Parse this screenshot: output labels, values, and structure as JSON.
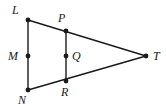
{
  "figure": {
    "background_color": "#ffffff",
    "stroke_color": "#1a1a1a",
    "label_color": "#1a1a1a",
    "point_radius": 2.4,
    "line_width": 1.4,
    "width": 166,
    "height": 109
  },
  "points": [
    {
      "id": "L",
      "label": "L",
      "x": 28,
      "y": 20,
      "label_x": 12,
      "label_y": 4
    },
    {
      "id": "P",
      "label": "P",
      "x": 66,
      "y": 31,
      "label_x": 58,
      "label_y": 12
    },
    {
      "id": "T",
      "label": "T",
      "x": 146,
      "y": 56,
      "label_x": 153,
      "label_y": 50
    },
    {
      "id": "M",
      "label": "M",
      "x": 28,
      "y": 56,
      "label_x": 8,
      "label_y": 50
    },
    {
      "id": "Q",
      "label": "Q",
      "x": 66,
      "y": 56,
      "label_x": 72,
      "label_y": 50
    },
    {
      "id": "N",
      "label": "N",
      "x": 28,
      "y": 90,
      "label_x": 18,
      "label_y": 94
    },
    {
      "id": "R",
      "label": "R",
      "x": 66,
      "y": 81,
      "label_x": 61,
      "label_y": 86
    }
  ],
  "segments": [
    {
      "id": "LT",
      "from": "L",
      "to": "T"
    },
    {
      "id": "NT",
      "from": "N",
      "to": "T"
    },
    {
      "id": "LN",
      "from": "L",
      "to": "N"
    },
    {
      "id": "PR",
      "from": "P",
      "to": "R"
    }
  ]
}
